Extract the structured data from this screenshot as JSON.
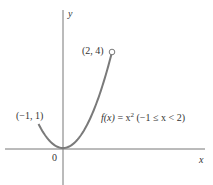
{
  "chart_data": {
    "type": "line",
    "title": "",
    "function_label": "f(x) = x² (−1 ≤ x < 2)",
    "xlabel": "x",
    "ylabel": "y",
    "origin_label": "0",
    "domain": [
      -1,
      2
    ],
    "x": [
      -1,
      -0.5,
      0,
      0.5,
      1,
      1.5,
      2
    ],
    "values": [
      1,
      0.25,
      0,
      0.25,
      1,
      2.25,
      4
    ],
    "annotations": [
      {
        "label": "(−1, 1)",
        "x": -1,
        "y": 1,
        "endpoint": "closed"
      },
      {
        "label": "(2, 4)",
        "x": 2,
        "y": 4,
        "endpoint": "open"
      }
    ],
    "grid": false,
    "colors": {
      "curve": "#7a7a7a",
      "axes": "#777777",
      "text": "#333333"
    }
  },
  "labels": {
    "y_axis": "y",
    "x_axis": "x",
    "origin": "0",
    "left_point": "(−1, 1)",
    "right_point": "(2, 4)",
    "f_of_x": "f(x)",
    "equals": " = x",
    "exponent": "2",
    "domain": "(−1 ≤ x < 2)"
  }
}
